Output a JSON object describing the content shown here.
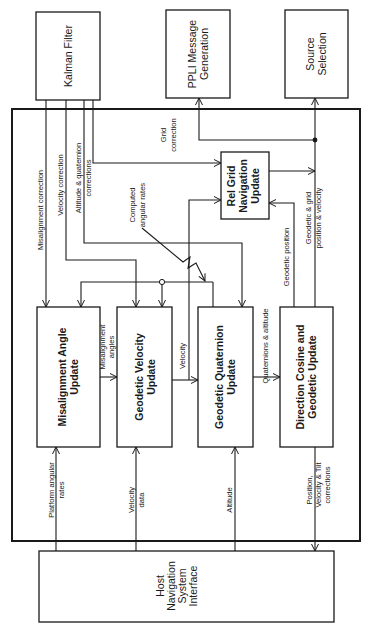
{
  "diagram": {
    "type": "block-diagram",
    "orientation": "rotated-90-ccw",
    "external_blocks": {
      "kalman": {
        "label": "Kalman Filter"
      },
      "ppli": {
        "line1": "PPLI Message",
        "line2": "Generation"
      },
      "source": {
        "line1": "Source",
        "line2": "Selection"
      },
      "host": {
        "line1": "Host",
        "line2": "Navigation",
        "line3": "System",
        "line4": "Interface"
      }
    },
    "internal_blocks": {
      "misalign": {
        "line1": "Misalignment Angle",
        "line2": "Update"
      },
      "velocity": {
        "line1": "Geodetic Velocity",
        "line2": "Update"
      },
      "quaternion": {
        "line1": "Geodetic Quaternion",
        "line2": "Update"
      },
      "dircos": {
        "line1": "Direction Cosine and",
        "line2": "Geodetic Update"
      },
      "relgrid": {
        "line1": "Rel Grid",
        "line2": "Navigation",
        "line3": "Update"
      }
    },
    "signals": {
      "misalignment_correction": "Misalignment correction",
      "velocity_correction": "Velocity correction",
      "altitude_quat_1": "Altitude & quaternion",
      "altitude_quat_2": "corrections",
      "grid_correction_1": "Grid",
      "grid_correction_2": "correction",
      "computed_rates_1": "Computed",
      "computed_rates_2": "angular rates",
      "geodetic_position": "Geodetic position",
      "geo_grid_1": "Geodetic & grid",
      "geo_grid_2": "position & velocity",
      "misalignment_angles_1": "Misalignment",
      "misalignment_angles_2": "angles",
      "velocity": "Velocity",
      "quat_altitude": "Quaternions & altitude",
      "platform_rates_1": "Platform angular",
      "platform_rates_2": "rates",
      "velocity_data_1": "Velocity",
      "velocity_data_2": "data",
      "altitude": "Altitude",
      "pvt_1": "Position,",
      "pvt_2": "Velocity & Tilt",
      "pvt_3": "corrections"
    },
    "colors": {
      "ink": "#1a1a1a",
      "background": "#ffffff"
    }
  }
}
